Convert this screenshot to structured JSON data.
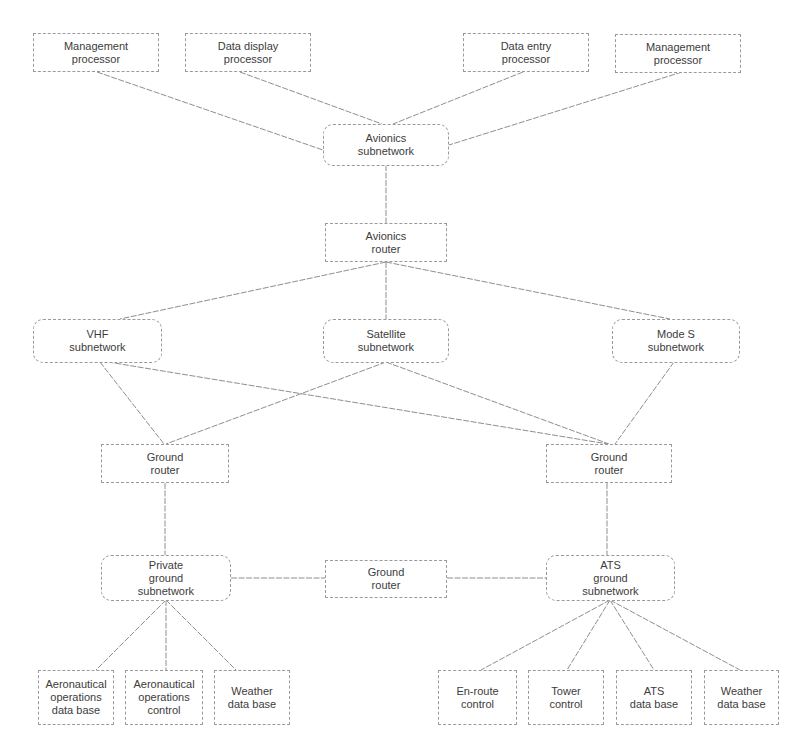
{
  "diagram": {
    "type": "network-architecture",
    "colors": {
      "line": "#8f8f8f",
      "border": "#9a9a9a",
      "text": "#3c3c3c",
      "background": "#ffffff"
    },
    "nodes": {
      "mgmt_proc_1": {
        "label": "Management\nprocessor",
        "shape": "rect"
      },
      "data_display": {
        "label": "Data display\nprocessor",
        "shape": "rect"
      },
      "data_entry": {
        "label": "Data entry\nprocessor",
        "shape": "rect"
      },
      "mgmt_proc_2": {
        "label": "Management\nprocessor",
        "shape": "rect"
      },
      "avionics_subnet": {
        "label": "Avionics\nsubnetwork",
        "shape": "rounded"
      },
      "avionics_router": {
        "label": "Avionics\nrouter",
        "shape": "rect"
      },
      "vhf_subnet": {
        "label": "VHF\nsubnetwork",
        "shape": "rounded"
      },
      "satellite_subnet": {
        "label": "Satellite\nsubnetwork",
        "shape": "rounded"
      },
      "modes_subnet": {
        "label": "Mode S\nsubnetwork",
        "shape": "rounded"
      },
      "ground_router_left": {
        "label": "Ground\nrouter",
        "shape": "rect"
      },
      "ground_router_right": {
        "label": "Ground\nrouter",
        "shape": "rect"
      },
      "private_ground_subnet": {
        "label": "Private\nground\nsubnetwork",
        "shape": "rounded"
      },
      "ground_router_mid": {
        "label": "Ground\nrouter",
        "shape": "rect"
      },
      "ats_ground_subnet": {
        "label": "ATS\nground\nsubnetwork",
        "shape": "rounded"
      },
      "aero_ops_db": {
        "label": "Aeronautical\noperations\ndata base",
        "shape": "rect"
      },
      "aero_ops_control": {
        "label": "Aeronautical\noperations\ncontrol",
        "shape": "rect"
      },
      "weather_db_left": {
        "label": "Weather\ndata base",
        "shape": "rect"
      },
      "enroute_control": {
        "label": "En-route\ncontrol",
        "shape": "rect"
      },
      "tower_control": {
        "label": "Tower\ncontrol",
        "shape": "rect"
      },
      "ats_db": {
        "label": "ATS\ndata base",
        "shape": "rect"
      },
      "weather_db_right": {
        "label": "Weather\ndata base",
        "shape": "rect"
      }
    },
    "edges": [
      [
        "mgmt_proc_1",
        "avionics_subnet"
      ],
      [
        "data_display",
        "avionics_subnet"
      ],
      [
        "data_entry",
        "avionics_subnet"
      ],
      [
        "mgmt_proc_2",
        "avionics_subnet"
      ],
      [
        "avionics_subnet",
        "avionics_router"
      ],
      [
        "avionics_router",
        "vhf_subnet"
      ],
      [
        "avionics_router",
        "satellite_subnet"
      ],
      [
        "avionics_router",
        "modes_subnet"
      ],
      [
        "vhf_subnet",
        "ground_router_left"
      ],
      [
        "vhf_subnet",
        "ground_router_right"
      ],
      [
        "satellite_subnet",
        "ground_router_left"
      ],
      [
        "satellite_subnet",
        "ground_router_right"
      ],
      [
        "modes_subnet",
        "ground_router_right"
      ],
      [
        "ground_router_left",
        "private_ground_subnet"
      ],
      [
        "ground_router_right",
        "ats_ground_subnet"
      ],
      [
        "private_ground_subnet",
        "ground_router_mid"
      ],
      [
        "ground_router_mid",
        "ats_ground_subnet"
      ],
      [
        "private_ground_subnet",
        "aero_ops_db"
      ],
      [
        "private_ground_subnet",
        "aero_ops_control"
      ],
      [
        "private_ground_subnet",
        "weather_db_left"
      ],
      [
        "ats_ground_subnet",
        "enroute_control"
      ],
      [
        "ats_ground_subnet",
        "tower_control"
      ],
      [
        "ats_ground_subnet",
        "ats_db"
      ],
      [
        "ats_ground_subnet",
        "weather_db_right"
      ]
    ]
  }
}
